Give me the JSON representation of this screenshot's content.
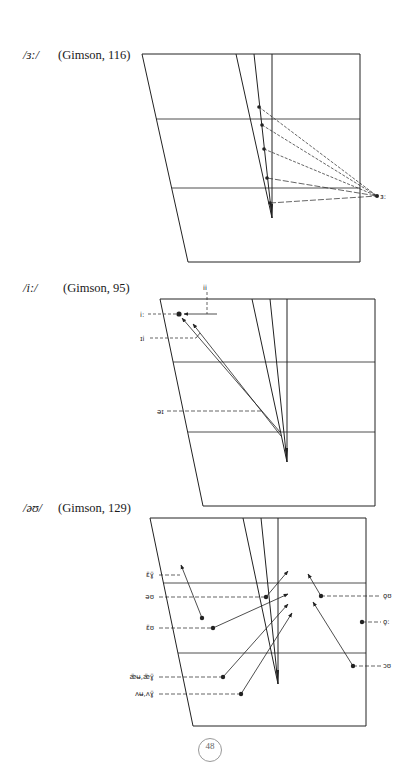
{
  "figures": [
    {
      "phoneme": "/ɜ:/",
      "source": "(Gimson, 116)",
      "caption_pos": {
        "x": 23,
        "y": 56
      },
      "frame": {
        "tl": [
          142,
          54
        ],
        "tr": [
          360,
          54
        ],
        "br": [
          360,
          262
        ],
        "bl": [
          188,
          262
        ]
      },
      "h_lines": [
        {
          "y": 119,
          "x1": 156,
          "x2": 360
        },
        {
          "y": 188,
          "x1": 172,
          "x2": 360
        }
      ],
      "wedge": [
        [
          236,
          54
        ],
        [
          254,
          54
        ],
        [
          272,
          54
        ],
        [
          272,
          218
        ]
      ],
      "points": [
        [
          259,
          107
        ],
        [
          262,
          125
        ],
        [
          264,
          149
        ],
        [
          267,
          178
        ],
        [
          270,
          203
        ]
      ],
      "target": {
        "point": [
          377,
          196
        ],
        "label": "ɜ:"
      }
    },
    {
      "phoneme": "/i:/",
      "source": "(Gimson, 95)",
      "caption_pos": {
        "x": 23,
        "y": 288
      },
      "frame": {
        "tl": [
          160,
          299
        ],
        "tr": [
          375,
          299
        ],
        "br": [
          375,
          506
        ],
        "bl": [
          203,
          506
        ]
      },
      "h_lines": [
        {
          "y": 362,
          "x1": 173,
          "x2": 375
        },
        {
          "y": 432,
          "x1": 188,
          "x2": 375
        }
      ],
      "wedge": [
        [
          252,
          299
        ],
        [
          270,
          299
        ],
        [
          287,
          299
        ],
        [
          287,
          462
        ]
      ],
      "vowel_point": {
        "point": [
          179,
          314
        ],
        "label": "i:"
      },
      "labels": [
        {
          "text": "ɪi",
          "x": 140,
          "y": 340,
          "line_to": 196
        },
        {
          "text": "əɪ",
          "x": 157,
          "y": 412,
          "line_to": 262
        },
        {
          "text": "ii",
          "x": 205,
          "y": 290
        }
      ]
    },
    {
      "phoneme": "/əʊ/",
      "source": "(Gimson, 129)",
      "caption_pos": {
        "x": 23,
        "y": 508
      },
      "frame": {
        "tl": [
          150,
          518
        ],
        "tr": [
          366,
          518
        ],
        "br": [
          366,
          726
        ],
        "bl": [
          193,
          726
        ]
      },
      "h_lines": [
        {
          "y": 583,
          "x1": 163,
          "x2": 366
        },
        {
          "y": 653,
          "x1": 178,
          "x2": 366
        }
      ],
      "wedge": [
        [
          243,
          518
        ],
        [
          261,
          518
        ],
        [
          278,
          518
        ],
        [
          278,
          684
        ]
      ],
      "left_labels": [
        {
          "text": "ɛ̈ɣ̈",
          "y": 575,
          "x_end": 180
        },
        {
          "text": "əʊ",
          "y": 597,
          "x_end": 266
        },
        {
          "text": "ɛ̈ʊ",
          "y": 628,
          "x_end": 213
        },
        {
          "text": "æ̈ʉ,æ̈ɣ̈",
          "y": 677,
          "x_end": 223
        },
        {
          "text": "ʌʉ,ʌɣ̈",
          "y": 694,
          "x_end": 241
        }
      ],
      "right_labels": [
        {
          "text": "o̞ʊ",
          "y": 596,
          "x_start": 321
        },
        {
          "text": "o̞:",
          "y": 622,
          "x_start": 362
        },
        {
          "text": "ɔʊ",
          "y": 666,
          "x_start": 353
        }
      ]
    }
  ],
  "page": {
    "number": "48"
  }
}
